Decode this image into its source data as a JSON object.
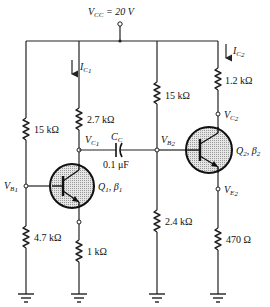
{
  "supply": {
    "label": "V",
    "sub": "CC",
    "value": " = 20 V"
  },
  "stage1": {
    "rb1": "15 kΩ",
    "rb2": "4.7 kΩ",
    "rc": "2.7 kΩ",
    "re": "1 kΩ",
    "current": {
      "label": "I",
      "sub": "C",
      "subsub": "1"
    },
    "node_c": {
      "label": "V",
      "sub": "C",
      "subsub": "1"
    },
    "node_b": {
      "label": "V",
      "sub": "B",
      "subsub": "1"
    },
    "transistor": {
      "name": "Q",
      "name_sub": "1",
      "beta": ", β",
      "beta_sub": "1"
    }
  },
  "coupling": {
    "cap_label": "C",
    "cap_sub": "C",
    "cap_value": "0.1 μF"
  },
  "stage2": {
    "rb1": "15 kΩ",
    "rb2": "2.4 kΩ",
    "rc": "1.2 kΩ",
    "re": "470 Ω",
    "current": {
      "label": "I",
      "sub": "C",
      "subsub": "2"
    },
    "node_c": {
      "label": "V",
      "sub": "C",
      "subsub": "2"
    },
    "node_b": {
      "label": "V",
      "sub": "B",
      "subsub": "2"
    },
    "node_e": {
      "label": "V",
      "sub": "E",
      "subsub": "2"
    },
    "transistor": {
      "name": "Q",
      "name_sub": "2",
      "beta": ", β",
      "beta_sub": "2"
    }
  }
}
